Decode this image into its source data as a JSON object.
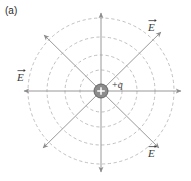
{
  "figure": {
    "panel_label": "(a)",
    "center": {
      "x": 101,
      "y": 91
    },
    "charge": {
      "symbol": "+",
      "label_sign": "+",
      "label_symbol": "q",
      "radius": 7,
      "fill_color": "#8c8c8c",
      "edge_color": "#555555"
    },
    "equipotential_circles": {
      "style": "dashed",
      "color": "#b9b9b9",
      "radii": [
        21,
        36,
        54,
        73
      ]
    },
    "field_lines": {
      "color": "#8d8d8d",
      "count": 8,
      "length": 84,
      "angles_deg": [
        0,
        45,
        90,
        135,
        180,
        225,
        270,
        315
      ],
      "arrowhead": "outward"
    },
    "labels": [
      {
        "name": "E-top-right",
        "text": "E",
        "vector": true
      },
      {
        "name": "E-left",
        "text": "E",
        "vector": true
      },
      {
        "name": "E-bottom-right",
        "text": "E",
        "vector": true
      }
    ],
    "colors": {
      "background": "#ffffff",
      "line": "#8d8d8d",
      "dash": "#b9b9b9",
      "text": "#3a3a3a",
      "panel_text": "#2b2b2b"
    }
  }
}
